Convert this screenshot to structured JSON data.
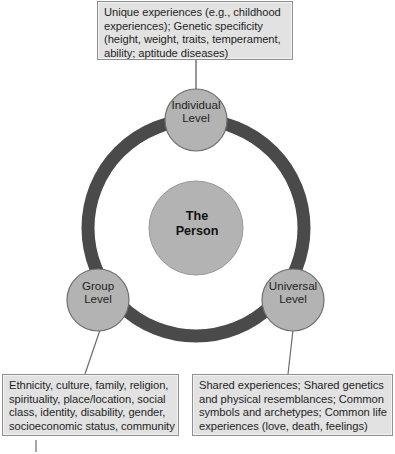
{
  "diagram": {
    "colors": {
      "ring": "#4a4a4a",
      "node_fill": "#b3b3b3",
      "node_stroke": "#6e6e6e",
      "center_fill": "#b3b3b3",
      "box_fill": "#e2e2e2",
      "box_stroke": "#8f8f8f",
      "connector": "#6b6b6b",
      "text": "#1f1f1f",
      "background": "#ffffff"
    },
    "center": {
      "name": "center-node",
      "line1": "The",
      "line2": "Person"
    },
    "nodes": {
      "individual": {
        "line1": "Individual",
        "line2": "Level"
      },
      "group": {
        "line1": "Group",
        "line2": "Level"
      },
      "universal": {
        "line1": "Universal",
        "line2": "Level"
      }
    },
    "callouts": {
      "individual": {
        "line1": "Unique experiences (e.g., childhood",
        "line2": "experiences); Genetic specificity",
        "line3": "(height, weight, traits, temperament,",
        "line4": "ability; aptitude diseases)"
      },
      "group": {
        "line1": "Ethnicity, culture, family, religion,",
        "line2": "spirituality, place/location, social",
        "line3": "class, identity, disability, gender,",
        "line4": "socioeconomic status, community"
      },
      "universal": {
        "line1": "Shared experiences; Shared genetics",
        "line2": "and physical resemblances; Common",
        "line3": "symbols and archetypes; Common life",
        "line4": "experiences (love, death, feelings)"
      }
    }
  }
}
